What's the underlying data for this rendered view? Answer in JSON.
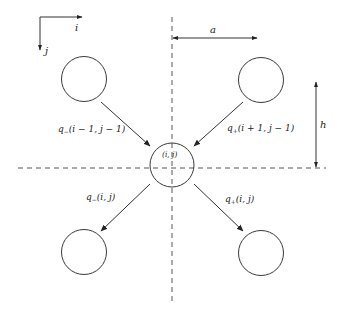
{
  "diagram": {
    "type": "lattice-flux-stencil",
    "colors": {
      "stroke": "#333333",
      "text": "#222222",
      "background": "#ffffff"
    },
    "axes": {
      "i_label": "i",
      "j_label": "j"
    },
    "dimensions": {
      "horizontal_spacing_label": "a",
      "vertical_spacing_label": "h"
    },
    "center_node": {
      "label": "(i, j)"
    },
    "nodes": [
      {
        "id": "top-left",
        "position": "upper-left"
      },
      {
        "id": "top-right",
        "position": "upper-right"
      },
      {
        "id": "center",
        "position": "center"
      },
      {
        "id": "bottom-left",
        "position": "lower-left"
      },
      {
        "id": "bottom-right",
        "position": "lower-right"
      }
    ],
    "arrows": [
      {
        "from": "top-left",
        "to": "center",
        "label_q": "q",
        "label_sub": "−",
        "label_args": "(i − 1, j − 1)"
      },
      {
        "from": "top-right",
        "to": "center",
        "label_q": "q",
        "label_sub": "+",
        "label_args": "(i + 1, j − 1)"
      },
      {
        "from": "center",
        "to": "bottom-left",
        "label_q": "q",
        "label_sub": "−",
        "label_args": "(i, j)"
      },
      {
        "from": "center",
        "to": "bottom-right",
        "label_q": "q",
        "label_sub": "+",
        "label_args": "(i, j)"
      }
    ]
  }
}
